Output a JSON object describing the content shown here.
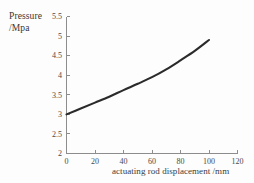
{
  "chart_data": {
    "type": "line",
    "title": "",
    "xlabel": "actuating rod displacement /mm",
    "ylabel_line1": "Pressure",
    "ylabel_line2": "/Mpa",
    "ylabel": "Pressure /Mpa",
    "xlim": [
      0,
      120
    ],
    "ylim": [
      2,
      5.5
    ],
    "grid": false,
    "legend": false,
    "x_ticks": [
      0,
      20,
      40,
      60,
      80,
      100,
      120
    ],
    "x_tick_labels": [
      "0",
      "20",
      "40",
      "60",
      "80",
      "100",
      "120"
    ],
    "y_ticks": [
      2,
      2.5,
      3,
      3.5,
      4,
      4.5,
      5,
      5.5
    ],
    "y_tick_labels": [
      "2",
      "2.5",
      "3",
      "3.5",
      "4",
      "4.5",
      "5",
      "5.5"
    ],
    "series": [
      {
        "name": "pressure",
        "color": "#2b2b2b",
        "x": [
          0,
          10,
          20,
          30,
          40,
          50,
          60,
          70,
          80,
          90,
          100
        ],
        "values": [
          3.0,
          3.15,
          3.3,
          3.45,
          3.62,
          3.78,
          3.95,
          4.15,
          4.38,
          4.62,
          4.9
        ]
      }
    ]
  }
}
